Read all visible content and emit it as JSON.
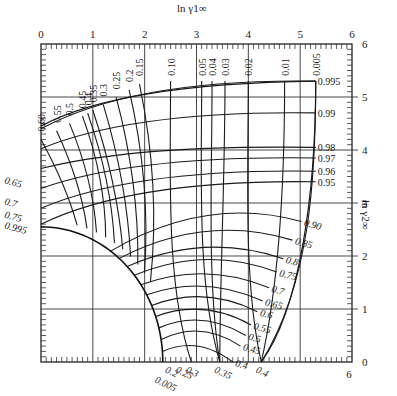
{
  "chart_data": {
    "type": "line",
    "title": "",
    "xlabel": "ln γ1∞",
    "ylabel": "ln γ2∞",
    "xlim": [
      0,
      6
    ],
    "ylim": [
      0,
      6
    ],
    "grid": true,
    "x_ticks": [
      "0",
      "1",
      "2",
      "3",
      "4",
      "5",
      "6"
    ],
    "y_ticks": [
      "0",
      "1",
      "2",
      "3",
      "4",
      "5",
      "6"
    ],
    "bottom_right_tick": "6",
    "family_A": {
      "description": "Near-vertical curves labeled along top edge",
      "labels": [
        "0.60",
        "0.55",
        "0.5",
        "0.45",
        "0.4",
        "0.35",
        "0.3",
        "0.25",
        "0.2",
        "0.15",
        "0.10",
        "0.05",
        "0.04",
        "0.03",
        "0.02",
        "0.01",
        "0.005"
      ],
      "top_x": [
        0.0,
        0.3,
        0.55,
        0.8,
        0.9,
        1.0,
        1.2,
        1.45,
        1.7,
        1.9,
        2.5,
        3.1,
        3.3,
        3.55,
        4.0,
        4.7,
        5.3
      ],
      "bottom_labels": [
        "0.005",
        "0.2",
        "0.25",
        "0.3",
        "0.35",
        "0.4"
      ],
      "bottom_x": [
        2.3,
        2.5,
        2.7,
        2.9,
        3.45,
        4.25
      ]
    },
    "family_B": {
      "description": "Near-horizontal curves labeled along right edge",
      "labels": [
        "0.995",
        "0.99",
        "0.98",
        "0.97",
        "0.96",
        "0.95",
        "0.90",
        "0.85",
        "0.8",
        "0.75",
        "0.7",
        "0.65",
        "0.6",
        "0.55",
        "0.5",
        "0.45",
        "0.4"
      ],
      "right_y": [
        5.3,
        4.7,
        4.05,
        3.85,
        3.6,
        3.4,
        2.65,
        2.3,
        1.95,
        1.7,
        1.4,
        1.15,
        0.95,
        0.7,
        0.5,
        0.3,
        0.0
      ],
      "left_labels": [
        "0.65",
        "0.7",
        "0.75",
        "0.995"
      ],
      "left_y": [
        3.45,
        3.05,
        2.8,
        2.6
      ]
    },
    "envelope": {
      "description": "Quarter-circle envelope boundary, approx centered at origin",
      "radius_x": 2.35,
      "radius_y": 2.55
    }
  }
}
